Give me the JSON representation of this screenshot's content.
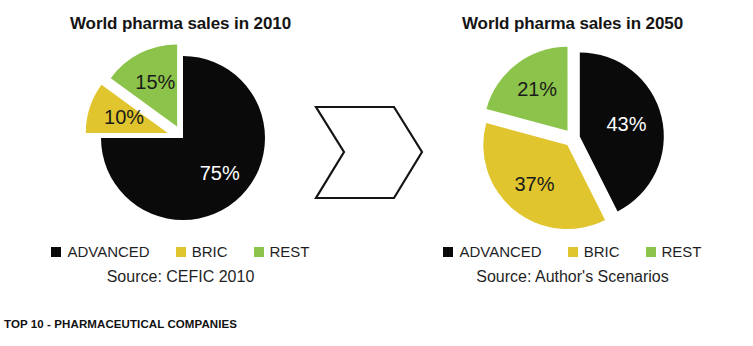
{
  "footer": {
    "caption": "TOP 10 - PHARMACEUTICAL COMPANIES"
  },
  "connector": {
    "icon": "right-arrow-chevron",
    "stroke": "#141414"
  },
  "colors": {
    "advanced": "#0A0A0A",
    "bric": "#E0C52E",
    "rest": "#8CC34A",
    "background": "#FFFFFF",
    "text": "#1A1A1A"
  },
  "panels": [
    {
      "id": "left",
      "title": "World pharma sales in 2010",
      "source": "Source: CEFIC 2010",
      "legend": [
        {
          "label": "ADVANCED",
          "color": "#0A0A0A"
        },
        {
          "label": "BRIC",
          "color": "#E0C52E"
        },
        {
          "label": "REST",
          "color": "#8CC34A"
        }
      ]
    },
    {
      "id": "right",
      "title": "World pharma sales in 2050",
      "source": "Source: Author's Scenarios",
      "legend": [
        {
          "label": "ADVANCED",
          "color": "#0A0A0A"
        },
        {
          "label": "BRIC",
          "color": "#E0C52E"
        },
        {
          "label": "REST",
          "color": "#8CC34A"
        }
      ]
    }
  ],
  "chart_data": [
    {
      "type": "pie",
      "title": "World pharma sales in 2010",
      "labels": [
        "ADVANCED",
        "BRIC",
        "REST"
      ],
      "values": [
        75,
        10,
        15
      ],
      "value_labels": [
        "75%",
        "10%",
        "15%"
      ],
      "colors": [
        "#0A0A0A",
        "#E0C52E",
        "#8CC34A"
      ],
      "explode": [
        0,
        1,
        1
      ],
      "start_angle_deg": 0,
      "direction": "clockwise",
      "units": "percent",
      "legend_position": "bottom",
      "source": "Source: CEFIC 2010"
    },
    {
      "type": "pie",
      "title": "World pharma sales in 2050",
      "labels": [
        "ADVANCED",
        "BRIC",
        "REST"
      ],
      "values": [
        43,
        37,
        21
      ],
      "value_labels": [
        "43%",
        "37%",
        "21%"
      ],
      "colors": [
        "#0A0A0A",
        "#E0C52E",
        "#8CC34A"
      ],
      "explode": [
        1,
        1,
        1
      ],
      "start_angle_deg": 0,
      "direction": "clockwise",
      "units": "percent",
      "legend_position": "bottom",
      "source": "Source: Author's Scenarios"
    }
  ]
}
